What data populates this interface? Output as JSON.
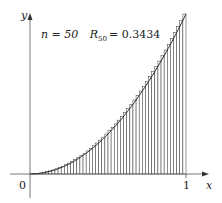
{
  "chart_data": {
    "type": "bar",
    "title": "",
    "annotation": {
      "n_label": "n = 50",
      "n": 50,
      "R_label": "R",
      "R_sub": "50",
      "R_value": "= 0.3434",
      "R50": 0.3434
    },
    "function": "x^2",
    "method": "right-endpoint Riemann sum",
    "n": 50,
    "x_range": [
      0,
      1
    ],
    "y_range": [
      0,
      1
    ],
    "xlabel": "x",
    "ylabel": "y",
    "x_ticks": [
      "0",
      "1"
    ],
    "origin_label": "0",
    "grid": false,
    "legend": false
  },
  "colors": {
    "fill": "#e0e0e0",
    "stroke": "#333333",
    "axis": "#555555",
    "curve": "#222222"
  }
}
